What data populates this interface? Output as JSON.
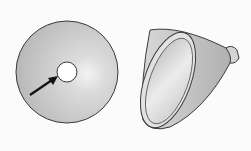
{
  "figure": {
    "objects": [
      {
        "name": "disc",
        "feature": "center-hole",
        "annotation": "arrow pointing to hole"
      },
      {
        "name": "cone-reflector",
        "feature": "flared rim with small neck"
      }
    ],
    "colors": {
      "fill_light": "#e8e8e8",
      "fill_mid": "#c4c4c4",
      "outline": "#3a3a3a",
      "arrow": "#111111"
    }
  }
}
